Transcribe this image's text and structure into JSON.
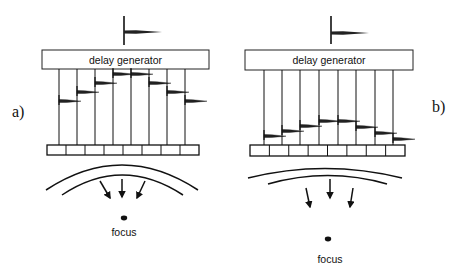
{
  "panels": [
    {
      "id": "a",
      "label": "a)",
      "delay_box_text": "delay generator",
      "focus_text": "focus",
      "description": "steered focus close to array",
      "box": {
        "x": 42,
        "y": 50,
        "w": 167,
        "h": 19
      },
      "input_pulse": {
        "x": 124,
        "y1": 16,
        "y2": 45,
        "py": 32,
        "tip": 162
      },
      "channel_x": [
        59,
        77,
        95,
        113,
        131,
        149,
        167,
        185
      ],
      "pulse_y": [
        101,
        92,
        83,
        74,
        74,
        83,
        92,
        101
      ],
      "array": {
        "x": 47,
        "y": 145,
        "w": 152,
        "h": 10,
        "elements": 8
      },
      "arc_outer": "M46 190 Q122 140 198 190",
      "arc_inner": "M62 195 Q122 155 183 195",
      "arrows": [
        [
          100,
          181,
          110,
          198
        ],
        [
          122,
          179,
          122,
          197
        ],
        [
          145,
          181,
          137,
          198
        ]
      ],
      "focus_dot": {
        "cx": 124,
        "cy": 218
      },
      "focus_label_pos": {
        "x": 124,
        "y": 236
      },
      "panel_label_pos": {
        "x": 12,
        "y": 117
      }
    },
    {
      "id": "b",
      "label": "b)",
      "delay_box_text": "delay generator",
      "focus_text": "focus",
      "description": "focus farther from array",
      "box": {
        "x": 245,
        "y": 50,
        "w": 168,
        "h": 20
      },
      "input_pulse": {
        "x": 331,
        "y1": 16,
        "y2": 44,
        "py": 33,
        "tip": 369
      },
      "channel_x": [
        264,
        282,
        300,
        319,
        338,
        356,
        375,
        393
      ],
      "pulse_y": [
        136,
        131,
        126,
        121,
        121,
        127,
        133,
        139
      ],
      "array": {
        "x": 250,
        "y": 145,
        "w": 155,
        "h": 11,
        "elements": 8
      },
      "arc_outer": "M248 178 Q325 159 402 178",
      "arc_inner": "M268 184 Q328 167 387 184",
      "arrows": [
        [
          306,
          188,
          310,
          207
        ],
        [
          330,
          179,
          330,
          198
        ],
        [
          353,
          188,
          350,
          207
        ]
      ],
      "focus_dot": {
        "cx": 328,
        "cy": 239
      },
      "focus_label_pos": {
        "x": 330,
        "y": 263
      },
      "panel_label_pos": {
        "x": 432,
        "y": 112
      }
    }
  ]
}
